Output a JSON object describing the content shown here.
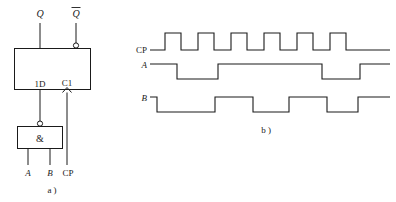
{
  "figure": {
    "panel_a": {
      "caption": "a )",
      "outputs": [
        {
          "name": "Q",
          "label": "Q",
          "inverted": false
        },
        {
          "name": "Q-bar",
          "label": "Q",
          "inverted": true
        }
      ],
      "flipflop": {
        "data_input_label": "1D",
        "clock_input_label": "C1",
        "dynamic_input": true
      },
      "gate": {
        "symbol": "&",
        "type": "nand",
        "output_inverted": true,
        "inputs": [
          "A",
          "B"
        ]
      },
      "clock_input_label": "CP"
    },
    "panel_b": {
      "caption": "b )",
      "signals": [
        {
          "name": "CP",
          "label": "CP"
        },
        {
          "name": "A",
          "label": "A"
        },
        {
          "name": "B",
          "label": "B"
        }
      ]
    }
  },
  "chart_data": {
    "type": "line",
    "title": "",
    "xlabel": "",
    "ylabel": "",
    "grid": false,
    "legend_position": "left",
    "xlim": [
      150,
      390
    ],
    "ylim": [
      0,
      1
    ],
    "series": [
      {
        "name": "CP",
        "label": "CP",
        "baseline_y": 50,
        "high_y": 33,
        "initial_level": 0,
        "transitions": [
          165,
          181,
          198,
          214,
          231,
          247,
          264,
          280,
          297,
          313,
          330,
          346
        ],
        "pulse_count": 6,
        "values": [
          0,
          1,
          0,
          1,
          0,
          1,
          0,
          1,
          0,
          1,
          0,
          1,
          0
        ]
      },
      {
        "name": "A",
        "label": "A",
        "baseline_y": 79,
        "high_y": 64,
        "initial_level": 1,
        "transitions": [
          177,
          218,
          322,
          360
        ],
        "values": [
          1,
          0,
          1,
          0,
          1
        ]
      },
      {
        "name": "B",
        "label": "B",
        "baseline_y": 112,
        "high_y": 97,
        "initial_level": 1,
        "transitions": [
          157,
          215,
          253,
          289,
          327,
          358
        ],
        "values": [
          1,
          0,
          1,
          0,
          1,
          0,
          1
        ]
      }
    ]
  },
  "colors": {
    "ink": "#1a1a1a",
    "background": "#ffffff"
  }
}
